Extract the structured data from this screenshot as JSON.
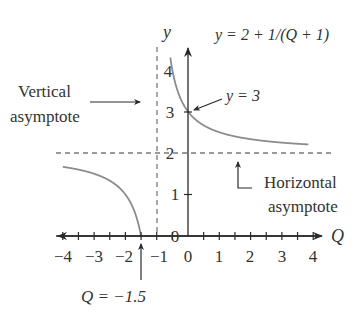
{
  "chart_data": {
    "type": "line",
    "title": "y = 2 + 1/(Q + 1)",
    "xlabel": "Q",
    "ylabel": "y",
    "xlim": [
      -4,
      4
    ],
    "ylim": [
      0,
      4
    ],
    "grid": false,
    "x_ticks": [
      -4,
      -3,
      -2,
      -1,
      0,
      1,
      2,
      3,
      4
    ],
    "x_tick_labels": [
      "−4",
      "−3",
      "−2",
      "−1",
      "0",
      "1",
      "2",
      "3",
      "4"
    ],
    "y_ticks": [
      0,
      1,
      2,
      3,
      4
    ],
    "y_tick_labels": [
      "0",
      "1",
      "2",
      "3",
      "4"
    ],
    "series": [
      {
        "name": "right branch",
        "function": "y = 2 + 1/(Q + 1)",
        "x": [
          -0.56,
          -0.5,
          -0.25,
          0,
          0.5,
          1,
          2,
          3,
          4
        ],
        "values": [
          4.27,
          4.0,
          3.33,
          3.0,
          2.67,
          2.5,
          2.33,
          2.25,
          2.2
        ]
      },
      {
        "name": "left branch",
        "function": "y = 2 + 1/(Q + 1)",
        "x": [
          -4,
          -3,
          -2.5,
          -2,
          -1.75,
          -1.5
        ],
        "values": [
          1.67,
          1.5,
          1.33,
          1.0,
          0.67,
          0.0
        ]
      }
    ],
    "asymptotes": {
      "vertical": {
        "Q": -1,
        "style": "dashed"
      },
      "horizontal": {
        "y": 2,
        "style": "dashed"
      }
    },
    "annotations": [
      {
        "text": "Vertical asymptote",
        "line1": "Vertical",
        "line2": "asymptote",
        "points_to": "Q = -1 dashed line"
      },
      {
        "text": "Horizontal asymptote",
        "line1": "Horizontal",
        "line2": "asymptote",
        "points_to": "y = 2 dashed line"
      },
      {
        "text": "y = 3",
        "points_to": [
          0,
          3
        ]
      },
      {
        "text": "Q = −1.5",
        "points_to": [
          -1.5,
          0
        ]
      }
    ]
  },
  "labels": {
    "equation": "y = 2 + 1/(Q + 1)",
    "y_axis": "y",
    "x_axis": "Q",
    "vertical_1": "Vertical",
    "vertical_2": "asymptote",
    "horizontal_1": "Horizontal",
    "horizontal_2": "asymptote",
    "y3": "y = 3",
    "q15": "Q = −1.5"
  },
  "colors": {
    "axis": "#2a2a2a",
    "curve": "#8c8c8c",
    "dashed": "#7a7a7a",
    "text": "#333333"
  }
}
